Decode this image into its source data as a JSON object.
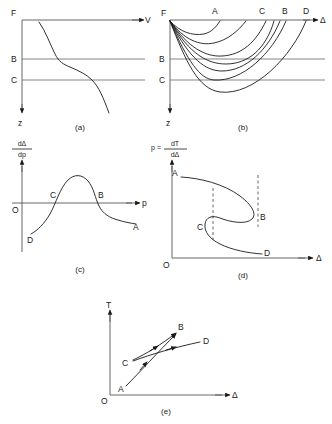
{
  "figure": {
    "type": "scientific-diagram",
    "panels": [
      {
        "id": "a",
        "caption": "(a)",
        "x_axis_label": "V",
        "y_axis_label": "z",
        "depth_levels": [
          "F",
          "B",
          "C"
        ],
        "description": "Velocity versus depth profile with reversed gradient between levels B and C"
      },
      {
        "id": "b",
        "caption": "(b)",
        "x_axis_label": "Δ",
        "y_axis_label": "z",
        "depth_levels": [
          "F",
          "B",
          "C"
        ],
        "surface_labels": [
          "F",
          "A",
          "C",
          "B",
          "D"
        ],
        "description": "Ray paths from source F bottoming at successively greater depths"
      },
      {
        "id": "c",
        "caption": "(c)",
        "x_axis_label": "p",
        "y_axis_numerator": "dΔ",
        "y_axis_denominator": "dp",
        "origin_label": "O",
        "point_labels": [
          "D",
          "C",
          "B",
          "A"
        ],
        "description": "dDelta/dp versus ray parameter p, positive peak between C and B"
      },
      {
        "id": "d",
        "caption": "(d)",
        "x_axis_label": "Δ",
        "y_axis_prefix": "p =",
        "y_axis_numerator": "dT",
        "y_axis_denominator": "dΔ",
        "origin_label": "O",
        "point_labels": [
          "A",
          "B",
          "C",
          "D"
        ],
        "description": "Ray parameter versus distance showing reversed S-shaped branch with cusps at B and C"
      },
      {
        "id": "e",
        "caption": "(e)",
        "x_axis_label": "Δ",
        "y_axis_label": "T",
        "origin_label": "O",
        "point_labels": [
          "A",
          "B",
          "C",
          "D"
        ],
        "description": "Travel-time curve showing triplication with branches A-B, C-B and C-D"
      }
    ]
  },
  "colors": {
    "ink": "#1a1a1a",
    "axis": "#555555",
    "level": "#666666",
    "background": "#ffffff"
  }
}
